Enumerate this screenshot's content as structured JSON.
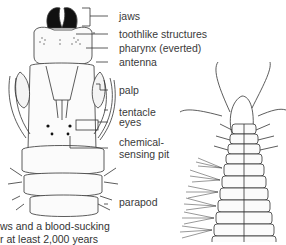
{
  "labels": {
    "jaws": "jaws",
    "toothlike": "toothlike structures",
    "pharynx": "pharynx (everted)",
    "antenna": "antenna",
    "palp": "palp",
    "tentacle": "tentacle",
    "eyes": "eyes",
    "chemical_1": "chemical-",
    "chemical_2": "sensing pit",
    "parapod": "parapod"
  },
  "caption": {
    "line1": "ws and a blood-sucking",
    "line2": "r at least 2,000 years"
  }
}
